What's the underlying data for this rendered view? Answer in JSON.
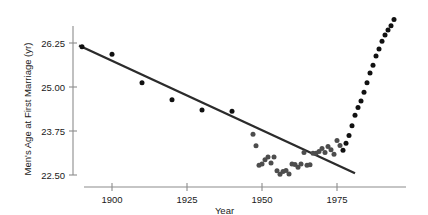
{
  "chart_data": {
    "type": "scatter",
    "title": "",
    "xlabel": "Year",
    "ylabel": "Men's Age at First Marriage (yr)",
    "xlim": [
      1888,
      1996
    ],
    "ylim": [
      22.1,
      27.1
    ],
    "xticks": [
      1900,
      1925,
      1950,
      1975
    ],
    "xtick_labels": [
      "1900",
      "1925",
      "1950",
      "1975"
    ],
    "yticks": [
      22.5,
      23.75,
      25.0,
      26.25
    ],
    "ytick_labels": [
      "22.50",
      "23.75",
      "25.00",
      "26.25"
    ],
    "grid": false,
    "legend": "none",
    "series": [
      {
        "name": "Men's median age at first marriage",
        "marker": "filled-circle",
        "color_early": "#4d4d4d",
        "color_late": "#111111",
        "points": [
          {
            "x": 1890,
            "y": 26.14,
            "shade": "dark"
          },
          {
            "x": 1900,
            "y": 25.93,
            "shade": "dark"
          },
          {
            "x": 1910,
            "y": 25.12,
            "shade": "dark"
          },
          {
            "x": 1920,
            "y": 24.64,
            "shade": "dark"
          },
          {
            "x": 1930,
            "y": 24.35,
            "shade": "dark"
          },
          {
            "x": 1940,
            "y": 24.31,
            "shade": "dark"
          },
          {
            "x": 1947,
            "y": 23.66,
            "shade": "gray"
          },
          {
            "x": 1948,
            "y": 23.33,
            "shade": "gray"
          },
          {
            "x": 1949,
            "y": 22.78,
            "shade": "gray"
          },
          {
            "x": 1950,
            "y": 22.81,
            "shade": "gray"
          },
          {
            "x": 1951,
            "y": 22.93,
            "shade": "gray"
          },
          {
            "x": 1952,
            "y": 23.01,
            "shade": "gray"
          },
          {
            "x": 1953,
            "y": 22.84,
            "shade": "gray"
          },
          {
            "x": 1954,
            "y": 23.01,
            "shade": "gray"
          },
          {
            "x": 1955,
            "y": 22.62,
            "shade": "gray"
          },
          {
            "x": 1956,
            "y": 22.52,
            "shade": "gray"
          },
          {
            "x": 1957,
            "y": 22.6,
            "shade": "gray"
          },
          {
            "x": 1958,
            "y": 22.63,
            "shade": "gray"
          },
          {
            "x": 1959,
            "y": 22.53,
            "shade": "gray"
          },
          {
            "x": 1960,
            "y": 22.81,
            "shade": "gray"
          },
          {
            "x": 1961,
            "y": 22.8,
            "shade": "gray"
          },
          {
            "x": 1962,
            "y": 22.72,
            "shade": "gray"
          },
          {
            "x": 1963,
            "y": 22.81,
            "shade": "gray"
          },
          {
            "x": 1964,
            "y": 23.14,
            "shade": "gray"
          },
          {
            "x": 1965,
            "y": 22.78,
            "shade": "gray"
          },
          {
            "x": 1966,
            "y": 22.79,
            "shade": "gray"
          },
          {
            "x": 1967,
            "y": 23.12,
            "shade": "gray"
          },
          {
            "x": 1968,
            "y": 23.12,
            "shade": "gray"
          },
          {
            "x": 1969,
            "y": 23.17,
            "shade": "gray"
          },
          {
            "x": 1970,
            "y": 23.25,
            "shade": "gray"
          },
          {
            "x": 1971,
            "y": 23.14,
            "shade": "gray"
          },
          {
            "x": 1972,
            "y": 23.31,
            "shade": "gray"
          },
          {
            "x": 1973,
            "y": 23.22,
            "shade": "gray"
          },
          {
            "x": 1974,
            "y": 23.09,
            "shade": "gray"
          },
          {
            "x": 1975,
            "y": 23.48,
            "shade": "gray"
          },
          {
            "x": 1976,
            "y": 23.34,
            "shade": "gray"
          },
          {
            "x": 1977,
            "y": 23.2,
            "shade": "dark"
          },
          {
            "x": 1978,
            "y": 23.4,
            "shade": "dark"
          },
          {
            "x": 1979,
            "y": 23.62,
            "shade": "dark"
          },
          {
            "x": 1980,
            "y": 23.9,
            "shade": "dark"
          },
          {
            "x": 1981,
            "y": 24.2,
            "shade": "dark"
          },
          {
            "x": 1982,
            "y": 24.42,
            "shade": "dark"
          },
          {
            "x": 1983,
            "y": 24.6,
            "shade": "dark"
          },
          {
            "x": 1984,
            "y": 24.85,
            "shade": "dark"
          },
          {
            "x": 1985,
            "y": 25.12,
            "shade": "dark"
          },
          {
            "x": 1986,
            "y": 25.4,
            "shade": "dark"
          },
          {
            "x": 1987,
            "y": 25.62,
            "shade": "dark"
          },
          {
            "x": 1988,
            "y": 25.88,
            "shade": "dark"
          },
          {
            "x": 1989,
            "y": 26.08,
            "shade": "dark"
          },
          {
            "x": 1990,
            "y": 26.3,
            "shade": "dark"
          },
          {
            "x": 1991,
            "y": 26.48,
            "shade": "dark"
          },
          {
            "x": 1992,
            "y": 26.62,
            "shade": "dark"
          },
          {
            "x": 1993,
            "y": 26.74,
            "shade": "dark"
          },
          {
            "x": 1994,
            "y": 26.92,
            "shade": "dark"
          }
        ]
      }
    ],
    "trend_line": {
      "name": "least-squares regression line",
      "color": "#2b2b2b",
      "x_start": 1889,
      "y_start": 26.18,
      "x_end": 1981,
      "y_end": 22.55
    }
  }
}
